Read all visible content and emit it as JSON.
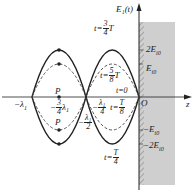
{
  "diagram": {
    "axes": {
      "vertical_label": "E₁(t)",
      "horizontal_label": "z",
      "origin_label": "O"
    },
    "y_ticks": [
      {
        "label": "2E",
        "sub": "i0",
        "value": 2
      },
      {
        "label": "E",
        "sub": "i0",
        "value": 1
      },
      {
        "label": "−E",
        "sub": "i0",
        "value": -1
      },
      {
        "label": "−2E",
        "sub": "i0",
        "value": -2
      }
    ],
    "x_ticks": {
      "minus_lambda1": {
        "sign": "−",
        "sym": "λ",
        "sub": "1"
      },
      "minus_three_quarter": {
        "sign": "−",
        "num": "3",
        "den": "4",
        "sym": "λ",
        "sub": "1"
      },
      "minus_half": {
        "sign": "−",
        "num": "λ₁",
        "den": "2"
      },
      "minus_quarter": {
        "sign": "−",
        "num": "λ₁",
        "den": "4"
      }
    },
    "curve_labels": {
      "t_three_quarter": {
        "prefix": "t=",
        "num": "3",
        "den": "4",
        "suffix": "T"
      },
      "t_five_eighth": {
        "prefix": "t=",
        "num": "5",
        "den": "8",
        "suffix": "T"
      },
      "t_zero": "t=0",
      "t_eighth": {
        "prefix": "t=",
        "num": "T",
        "den": "8"
      },
      "t_quarter": {
        "prefix": "t=",
        "num": "T",
        "den": "4"
      }
    },
    "points": {
      "P_upper": "P",
      "P_lower": "P"
    },
    "region": {
      "fill": "#c8c8c8",
      "hatch": "#888888"
    },
    "curve_color": "#222222"
  }
}
